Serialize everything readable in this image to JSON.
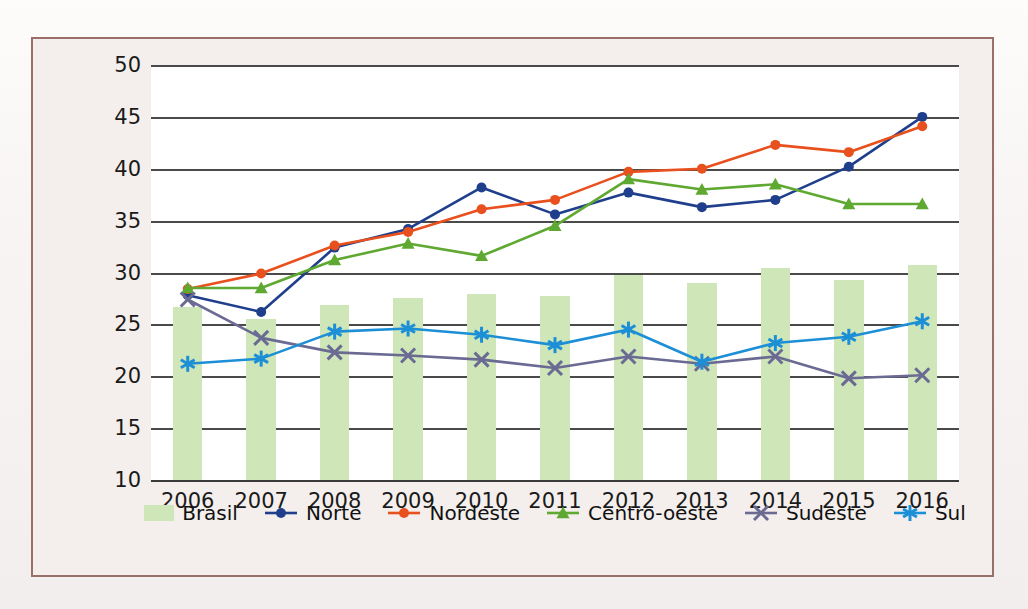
{
  "figure": {
    "frame_color": "#9a6f6a",
    "panel_color": "#f4efed"
  },
  "chart_data": {
    "type": "bar",
    "title": "",
    "subtitle": "",
    "xlabel": "",
    "ylabel": "",
    "grid": true,
    "legend_position": "bottom",
    "ylim": [
      10,
      50
    ],
    "yticks": [
      10,
      15,
      20,
      25,
      30,
      35,
      40,
      45,
      50
    ],
    "ytick_labels": [
      "10",
      "15",
      "20",
      "25",
      "30",
      "35",
      "40",
      "45",
      "50"
    ],
    "categories": [
      "2006",
      "2007",
      "2008",
      "2009",
      "2010",
      "2011",
      "2012",
      "2013",
      "2014",
      "2015",
      "2016"
    ],
    "series": [
      {
        "name": "Brasil",
        "kind": "bar",
        "color": "#cfe6b9",
        "marker": "none",
        "values": [
          26.7,
          25.5,
          26.9,
          27.5,
          27.9,
          27.7,
          29.8,
          29.0,
          30.4,
          29.3,
          30.7
        ]
      },
      {
        "name": "Norte",
        "kind": "line",
        "color": "#1f3f8c",
        "marker": "circle",
        "values": [
          27.8,
          26.2,
          32.4,
          34.2,
          38.2,
          35.6,
          37.7,
          36.3,
          37.0,
          40.2,
          45.0
        ]
      },
      {
        "name": "Nordeste",
        "kind": "line",
        "color": "#e8501e",
        "marker": "circle",
        "values": [
          28.4,
          29.9,
          32.6,
          33.9,
          36.1,
          37.0,
          39.7,
          40.0,
          42.3,
          41.6,
          44.1
        ]
      },
      {
        "name": "Centro-oeste",
        "kind": "line",
        "color": "#5fa832",
        "marker": "triangle",
        "values": [
          28.5,
          28.5,
          31.2,
          32.8,
          31.6,
          34.5,
          39.0,
          38.0,
          38.5,
          36.6,
          36.6
        ]
      },
      {
        "name": "Sudeste",
        "kind": "line",
        "color": "#6a6a93",
        "marker": "x",
        "values": [
          27.4,
          23.7,
          22.3,
          22.0,
          21.6,
          20.8,
          21.9,
          21.2,
          21.9,
          19.8,
          20.1
        ]
      },
      {
        "name": "Sul",
        "kind": "line",
        "color": "#1c8fd6",
        "marker": "asterisk",
        "values": [
          21.2,
          21.7,
          24.3,
          24.6,
          24.0,
          23.0,
          24.5,
          21.4,
          23.2,
          23.8,
          25.3
        ]
      }
    ]
  },
  "legend": {
    "entries": [
      {
        "label": "Brasil",
        "type": "bar",
        "color": "#cfe6b9",
        "marker": "none"
      },
      {
        "label": "Norte",
        "type": "line",
        "color": "#1f3f8c",
        "marker": "circle"
      },
      {
        "label": "Nordeste",
        "type": "line",
        "color": "#e8501e",
        "marker": "circle"
      },
      {
        "label": "Centro-oeste",
        "type": "line",
        "color": "#5fa832",
        "marker": "triangle"
      },
      {
        "label": "Sudeste",
        "type": "line",
        "color": "#6a6a93",
        "marker": "x"
      },
      {
        "label": "Sul",
        "type": "line",
        "color": "#1c8fd6",
        "marker": "asterisk"
      }
    ]
  }
}
